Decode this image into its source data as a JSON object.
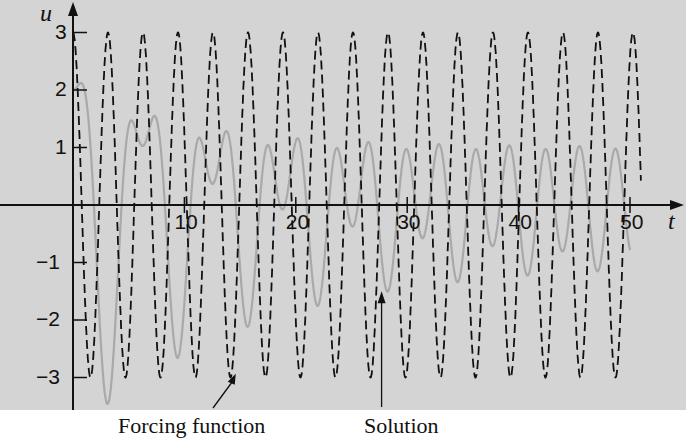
{
  "chart_data": {
    "type": "line",
    "title": "",
    "xlabel": "t",
    "ylabel": "u",
    "xlim": [
      0,
      51
    ],
    "ylim": [
      -3.5,
      3.3
    ],
    "x_ticks": [
      10,
      20,
      30,
      40,
      50
    ],
    "x_tick_labels": [
      "10",
      "20",
      "30",
      "40",
      "50"
    ],
    "y_ticks": [
      3,
      2,
      1,
      -1,
      -2,
      -3
    ],
    "y_tick_labels": [
      "3",
      "2",
      "1",
      "-1",
      "-2",
      "-3"
    ],
    "grid": false,
    "series": [
      {
        "name": "Forcing function",
        "expression": "3 cos(2t)",
        "style": "dashed",
        "color": "#111111",
        "amplitude": 3,
        "omega": 2
      },
      {
        "name": "Solution",
        "expression": "u'' + 0.125u' + u = 3cos(2t), u(0)=2, u'(0)=0",
        "style": "solid",
        "color": "#a9a9a9",
        "initial_u": 2,
        "initial_du": 0,
        "damping": 0.125
      }
    ],
    "annotations": [
      {
        "text": "Forcing function",
        "arrow_to_t": 14.7,
        "arrow_to_u": -2.9
      },
      {
        "text": "Solution",
        "arrow_to_t": 27.7,
        "arrow_to_u": -1.5
      }
    ]
  },
  "labels": {
    "x_axis": "t",
    "y_axis": "u",
    "forcing": "Forcing function",
    "solution": "Solution"
  }
}
